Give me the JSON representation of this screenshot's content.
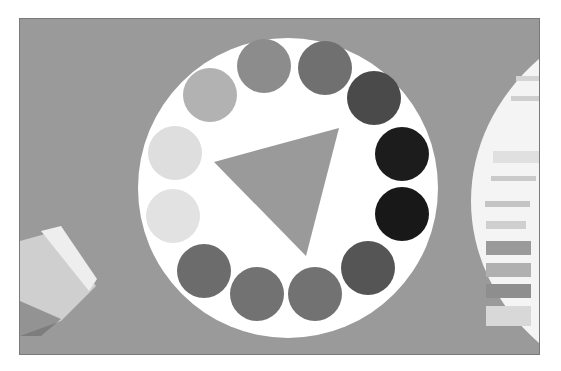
{
  "image": {
    "subject": "color-wheel",
    "background_color": "#9a9a9a",
    "wheel": {
      "cx": 287,
      "cy": 187,
      "r": 150,
      "fill": "#ffffff"
    },
    "triangle": {
      "points": "213,161 338,127 305,255",
      "fill": "#9a9a9a"
    },
    "swatches": [
      {
        "cx": 263,
        "cy": 65,
        "fill": "#8c8c8c"
      },
      {
        "cx": 324,
        "cy": 67,
        "fill": "#707070"
      },
      {
        "cx": 373,
        "cy": 97,
        "fill": "#4a4a4a"
      },
      {
        "cx": 401,
        "cy": 153,
        "fill": "#1c1c1c"
      },
      {
        "cx": 401,
        "cy": 213,
        "fill": "#181818"
      },
      {
        "cx": 367,
        "cy": 267,
        "fill": "#555555"
      },
      {
        "cx": 314,
        "cy": 293,
        "fill": "#727272"
      },
      {
        "cx": 256,
        "cy": 293,
        "fill": "#727272"
      },
      {
        "cx": 203,
        "cy": 270,
        "fill": "#6c6c6c"
      },
      {
        "cx": 172,
        "cy": 215,
        "fill": "#e2e2e2"
      },
      {
        "cx": 174,
        "cy": 152,
        "fill": "#dedede"
      },
      {
        "cx": 209,
        "cy": 94,
        "fill": "#b2b2b2"
      }
    ],
    "paint_tube": {
      "label": "paint-tube"
    },
    "side_wheel": {
      "label": "partial-second-color-wheel"
    }
  }
}
